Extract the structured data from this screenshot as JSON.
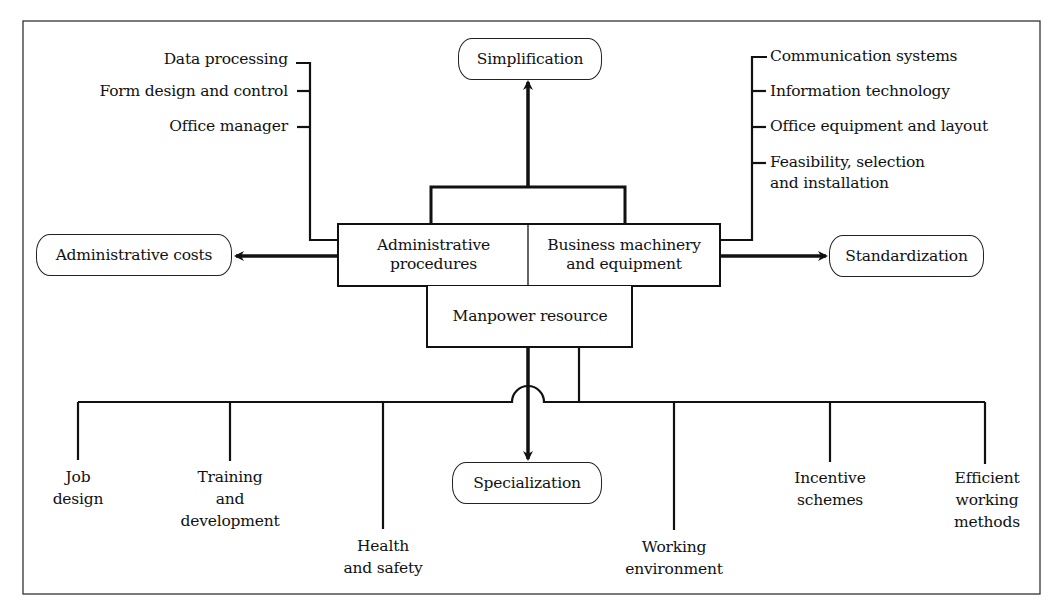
{
  "diagram": {
    "center": {
      "admin_procedures": "Administrative procedures",
      "admin_procedures_l1": "Administrative",
      "admin_procedures_l2": "procedures",
      "business_machinery_l1": "Business machinery",
      "business_machinery_l2": "and equipment",
      "manpower": "Manpower resource"
    },
    "outcomes": {
      "top": "Simplification",
      "left": "Administrative costs",
      "right": "Standardization",
      "bottom": "Specialization"
    },
    "admin_factors": [
      "Data processing",
      "Form design and control",
      "Office manager"
    ],
    "machinery_factors": [
      "Communication systems",
      "Information technology",
      "Office equipment and layout",
      "Feasibility, selection",
      "and installation"
    ],
    "manpower_factors": [
      {
        "l1": "Job",
        "l2": "design",
        "l3": ""
      },
      {
        "l1": "Training",
        "l2": "and",
        "l3": "development"
      },
      {
        "l1": "Health",
        "l2": "and safety",
        "l3": ""
      },
      {
        "l1": "Working",
        "l2": "environment",
        "l3": ""
      },
      {
        "l1": "Incentive",
        "l2": "schemes",
        "l3": ""
      },
      {
        "l1": "Efficient",
        "l2": "working",
        "l3": "methods"
      }
    ]
  }
}
